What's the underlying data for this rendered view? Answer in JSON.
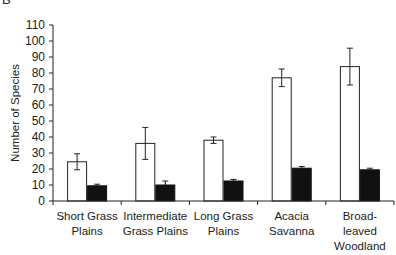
{
  "panel_letter": "B",
  "chart_data": {
    "type": "bar",
    "title": "",
    "xlabel": "",
    "ylabel": "Number of Species",
    "ylim": [
      0,
      110
    ],
    "yticks": [
      0,
      10,
      20,
      30,
      40,
      50,
      60,
      70,
      80,
      90,
      100,
      110
    ],
    "grid": false,
    "legend": null,
    "categories": [
      [
        "Short Grass",
        "Plains"
      ],
      [
        "Intermediate",
        "Grass Plains"
      ],
      [
        "Long Grass",
        "Plains"
      ],
      [
        "Acacia",
        "Savanna"
      ],
      [
        "Broad-",
        "leaved",
        "Woodland"
      ]
    ],
    "series": [
      {
        "name": "open",
        "color": "#ffffff",
        "stroke": "#222222",
        "values": [
          24.5,
          36,
          38,
          77,
          84
        ],
        "error": [
          5,
          10,
          2,
          5.5,
          11.5
        ]
      },
      {
        "name": "filled",
        "color": "#111111",
        "stroke": "#111111",
        "values": [
          9.5,
          10,
          12.5,
          20.5,
          19.5
        ],
        "error": [
          1,
          2.5,
          1,
          1,
          1
        ]
      }
    ]
  }
}
